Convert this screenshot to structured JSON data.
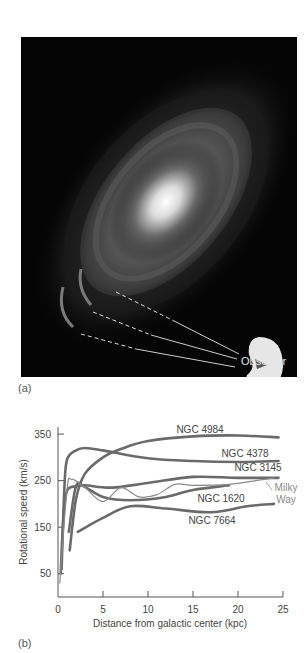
{
  "figure": {
    "panel_a_label": "(a)",
    "panel_b_label": "(b)",
    "observer_label": "Observer"
  },
  "colors": {
    "curve": "#6a6a6a",
    "milky_way": "#8a8a8a",
    "axis": "#555555",
    "text": "#444444",
    "photo_bg": "#050505"
  },
  "chart_data": {
    "type": "line",
    "title": "",
    "xlabel": "Distance from galactic center (kpc)",
    "ylabel": "Rotational speed (km/s)",
    "xlim": [
      0,
      25
    ],
    "ylim": [
      0,
      370
    ],
    "xticks": [
      0,
      5,
      10,
      15,
      20,
      25
    ],
    "yticks": [
      50,
      150,
      250,
      350
    ],
    "grid": false,
    "legend": "inline labels",
    "series": [
      {
        "name": "NGC 4984",
        "x": [
          1.3,
          2,
          3,
          5,
          7,
          10,
          15,
          20,
          24.5
        ],
        "values": [
          100,
          210,
          265,
          300,
          318,
          335,
          345,
          347,
          343
        ]
      },
      {
        "name": "NGC 4378",
        "x": [
          0.4,
          0.7,
          1,
          2,
          3,
          5,
          10,
          15,
          20,
          24.5
        ],
        "values": [
          60,
          230,
          295,
          315,
          320,
          315,
          298,
          292,
          290,
          292
        ]
      },
      {
        "name": "NGC 3145",
        "x": [
          0.3,
          0.6,
          1,
          2,
          3,
          6,
          10,
          15,
          20,
          24.5
        ],
        "values": [
          50,
          170,
          228,
          238,
          240,
          235,
          245,
          258,
          256,
          256
        ]
      },
      {
        "name": "NGC 1620",
        "x": [
          1.2,
          2,
          3,
          5,
          8,
          12,
          15,
          19
        ],
        "values": [
          140,
          238,
          236,
          215,
          208,
          215,
          230,
          240
        ]
      },
      {
        "name": "Milky Way",
        "x": [
          0.2,
          1,
          1.5,
          3,
          5,
          7,
          9,
          11,
          13,
          15,
          19,
          22,
          24
        ],
        "values": [
          30,
          230,
          253,
          235,
          205,
          235,
          215,
          220,
          242,
          240,
          242,
          250,
          256
        ]
      },
      {
        "name": "NGC 7664",
        "x": [
          2.2,
          5,
          8,
          12,
          17,
          21,
          24
        ],
        "values": [
          140,
          170,
          195,
          190,
          182,
          195,
          200
        ]
      }
    ],
    "annotations": [
      "NGC 4984",
      "NGC 4378",
      "NGC 3145",
      "Milky Way",
      "NGC 1620",
      "NGC 7664"
    ]
  }
}
